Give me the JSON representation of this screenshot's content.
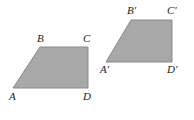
{
  "figure": {
    "background_color": "#ffffff",
    "fill_color": "#a8a8a8",
    "stroke_color": "#8a8a8a",
    "label_color": "#1a1a1a"
  },
  "shapes": [
    {
      "name": "trapezoid-abcd",
      "points": "40,47 88,47 88,88 13,88",
      "vertices": [
        {
          "key": "A",
          "label": "A",
          "x": 13,
          "y": 88,
          "label_x": 9,
          "label_y": 91
        },
        {
          "key": "B",
          "label": "B",
          "x": 40,
          "y": 47,
          "label_x": 37,
          "label_y": 33
        },
        {
          "key": "C",
          "label": "C",
          "x": 88,
          "y": 47,
          "label_x": 83,
          "label_y": 33
        },
        {
          "key": "D",
          "label": "D",
          "x": 88,
          "y": 88,
          "label_x": 83,
          "label_y": 91
        }
      ]
    },
    {
      "name": "trapezoid-abcd-prime",
      "points": "131,20 172,20 172,62 106,62",
      "vertices": [
        {
          "key": "A_prime",
          "label": "A′",
          "x": 106,
          "y": 62,
          "label_x": 100,
          "label_y": 64
        },
        {
          "key": "B_prime",
          "label": "B′",
          "x": 131,
          "y": 20,
          "label_x": 127,
          "label_y": 5
        },
        {
          "key": "C_prime",
          "label": "C′",
          "x": 172,
          "y": 20,
          "label_x": 167,
          "label_y": 5
        },
        {
          "key": "D_prime",
          "label": "D′",
          "x": 172,
          "y": 62,
          "label_x": 167,
          "label_y": 64
        }
      ]
    }
  ]
}
